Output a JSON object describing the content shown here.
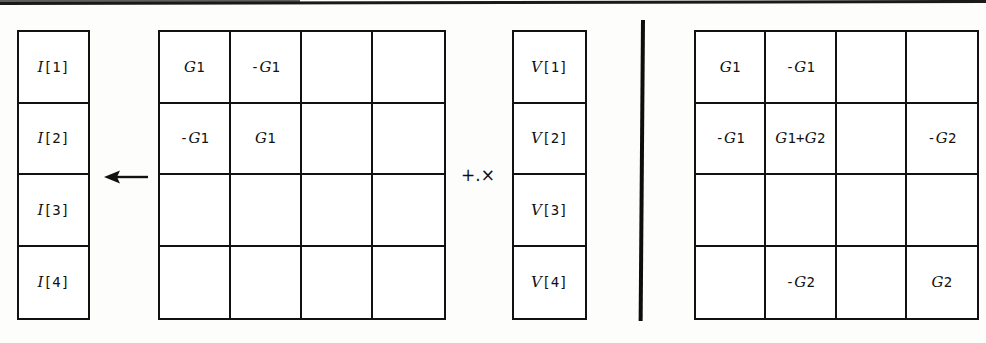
{
  "figure": {
    "top_rule": "horizontal-rule",
    "operator_symbol": "+.×",
    "arrow_symbol": "left-arrow",
    "separator_symbol": "vertical-bar"
  },
  "i_vector": {
    "name": "I",
    "cells": [
      "I[1]",
      "I[2]",
      "I[3]",
      "I[4]"
    ]
  },
  "v_vector": {
    "name": "V",
    "cells": [
      "V[1]",
      "V[2]",
      "V[3]",
      "V[4]"
    ]
  },
  "matrix_left": {
    "rows": [
      [
        "G1",
        "-G1",
        "",
        ""
      ],
      [
        "-G1",
        "G1",
        "",
        ""
      ],
      [
        "",
        "",
        "",
        ""
      ],
      [
        "",
        "",
        "",
        ""
      ]
    ]
  },
  "matrix_right": {
    "rows": [
      [
        "G1",
        "-G1",
        "",
        ""
      ],
      [
        "-G1",
        "G1+G2",
        "",
        "-G2"
      ],
      [
        "",
        "",
        "",
        ""
      ],
      [
        "",
        "-G2",
        "",
        "G2"
      ]
    ]
  },
  "colors": {
    "ink": "#111111",
    "paper": "#fdfdfc"
  }
}
